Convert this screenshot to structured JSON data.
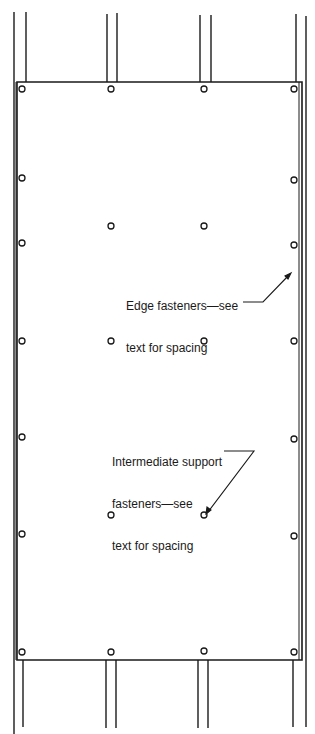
{
  "diagram": {
    "type": "panel fastening schedule",
    "colors": {
      "line": "#1a1a1a",
      "background": "#ffffff"
    },
    "panel": {
      "x": 17,
      "y": 82,
      "width": 285,
      "height": 578
    },
    "studs": [
      {
        "x1": 14,
        "x2": 26
      },
      {
        "x1": 107,
        "x2": 117
      },
      {
        "x1": 200,
        "x2": 211
      },
      {
        "x1": 296,
        "x2": 306
      }
    ],
    "edge_fasteners": [
      [
        22,
        89
      ],
      [
        111,
        89
      ],
      [
        204,
        89
      ],
      [
        294,
        89
      ],
      [
        22,
        178
      ],
      [
        294,
        180
      ],
      [
        22,
        243
      ],
      [
        294,
        245
      ],
      [
        22,
        341
      ],
      [
        294,
        341
      ],
      [
        22,
        437
      ],
      [
        294,
        439
      ],
      [
        22,
        534
      ],
      [
        294,
        536
      ],
      [
        22,
        652
      ],
      [
        111,
        652
      ],
      [
        204,
        651
      ],
      [
        294,
        652
      ]
    ],
    "intermediate_fasteners": [
      [
        111,
        226
      ],
      [
        204,
        226
      ],
      [
        111,
        341
      ],
      [
        204,
        341
      ],
      [
        111,
        515
      ],
      [
        204,
        515
      ]
    ],
    "annotations": [
      {
        "id": "edge",
        "lines": [
          "Edge fasteners—see",
          "text for spacing"
        ],
        "x": 126,
        "y": 271,
        "leader": "M243,302 L263,302 L289,275"
      },
      {
        "id": "intermediate",
        "lines": [
          "Intermediate support",
          "fasteners—see",
          "text for spacing"
        ],
        "x": 112,
        "y": 428,
        "leader": "M224,451 L254,451 L208,512"
      }
    ]
  },
  "labels": {
    "edge_line1": "Edge fasteners—see",
    "edge_line2": "text for spacing",
    "intermediate_line1": "Intermediate support",
    "intermediate_line2": "fasteners—see",
    "intermediate_line3": "text for spacing"
  }
}
